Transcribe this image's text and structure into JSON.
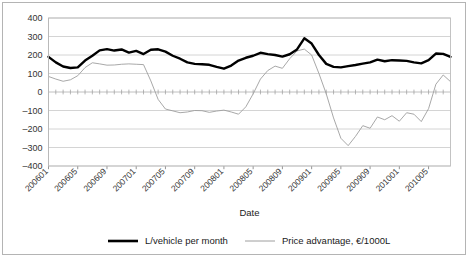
{
  "chart_data": {
    "type": "line",
    "title": "",
    "xlabel": "Date",
    "ylabel": "",
    "ylim": [
      -400,
      400
    ],
    "ytick_step": 100,
    "yticks": [
      "400",
      "300",
      "200",
      "100",
      "0",
      "-100",
      "-200",
      "-300",
      "-400"
    ],
    "grid": true,
    "legend_position": "bottom",
    "x": [
      "200601",
      "200602",
      "200603",
      "200604",
      "200605",
      "200606",
      "200607",
      "200608",
      "200609",
      "200610",
      "200611",
      "200612",
      "200701",
      "200702",
      "200703",
      "200704",
      "200705",
      "200706",
      "200707",
      "200708",
      "200709",
      "200710",
      "200711",
      "200712",
      "200801",
      "200802",
      "200803",
      "200804",
      "200805",
      "200806",
      "200807",
      "200808",
      "200809",
      "200810",
      "200811",
      "200812",
      "200901",
      "200902",
      "200903",
      "200904",
      "200905",
      "200906",
      "200907",
      "200908",
      "200909",
      "200910",
      "200911",
      "200912",
      "201001",
      "201002",
      "201003",
      "201004",
      "201005",
      "201006",
      "201007",
      "201008"
    ],
    "xtick_labels": [
      "200601",
      "200605",
      "200609",
      "200701",
      "200705",
      "200709",
      "200801",
      "200805",
      "200809",
      "200901",
      "200905",
      "200909",
      "201001",
      "201005"
    ],
    "xtick_every": 4,
    "series": [
      {
        "name": "L/vehicle per month",
        "color": "#000000",
        "width": 2.4,
        "values": [
          190,
          160,
          138,
          130,
          133,
          170,
          196,
          225,
          232,
          224,
          230,
          213,
          222,
          205,
          228,
          231,
          218,
          196,
          180,
          160,
          152,
          150,
          147,
          136,
          126,
          143,
          170,
          185,
          196,
          212,
          205,
          200,
          191,
          204,
          230,
          290,
          262,
          200,
          152,
          136,
          133,
          140,
          146,
          153,
          160,
          175,
          166,
          172,
          170,
          168,
          160,
          155,
          172,
          208,
          206,
          190
        ]
      },
      {
        "name": "Price advantage, €/1000L",
        "color": "#9e9e9e",
        "width": 0.9,
        "values": [
          84,
          70,
          58,
          66,
          88,
          132,
          158,
          152,
          145,
          146,
          150,
          152,
          150,
          148,
          60,
          -40,
          -92,
          -102,
          -112,
          -108,
          -100,
          -101,
          -110,
          -103,
          -98,
          -108,
          -120,
          -80,
          -10,
          70,
          116,
          140,
          128,
          180,
          222,
          232,
          200,
          100,
          -10,
          -140,
          -250,
          -290,
          -240,
          -182,
          -196,
          -135,
          -150,
          -128,
          -158,
          -112,
          -120,
          -160,
          -90,
          42,
          92,
          56
        ]
      }
    ]
  },
  "legend": {
    "items": [
      {
        "label": "L/vehicle per month"
      },
      {
        "label": "Price advantage, €/1000L"
      }
    ]
  },
  "axis": {
    "x_title": "Date"
  }
}
